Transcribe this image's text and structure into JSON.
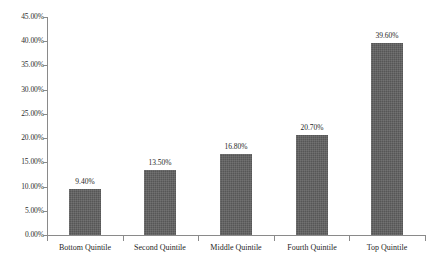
{
  "chart_data": {
    "type": "bar",
    "title": "",
    "subtitle": "",
    "xlabel": "",
    "ylabel": "",
    "categories": [
      "Bottom Quintile",
      "Second Quintile",
      "Middle Quintile",
      "Fourth Quintile",
      "Top Quintile"
    ],
    "values": [
      9.4,
      13.5,
      16.8,
      20.7,
      39.6
    ],
    "value_labels": [
      "9.40%",
      "13.50%",
      "16.80%",
      "20.70%",
      "39.60%"
    ],
    "ylim": [
      0,
      45
    ],
    "ytick_values": [
      0,
      5,
      10,
      15,
      20,
      25,
      30,
      35,
      40,
      45
    ],
    "ytick_labels": [
      "0.00%",
      "5.00%",
      "10.00%",
      "15.00%",
      "20.00%",
      "25.00%",
      "30.00%",
      "35.00%",
      "40.00%",
      "45.00%"
    ],
    "grid": false,
    "legend": false,
    "legend_position": "none",
    "bar_color": "#565656",
    "axis_color": "#8a8a8a",
    "text_color": "#1f1f1f"
  }
}
